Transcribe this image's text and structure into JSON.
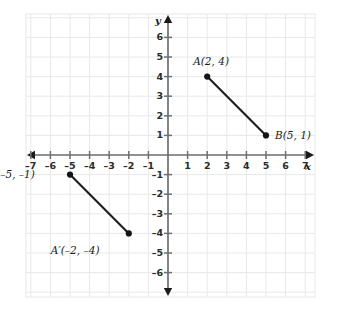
{
  "figure": {
    "type": "coordinate-plane",
    "axis_labels": {
      "x": "x",
      "y": "y"
    },
    "x_axis": {
      "min": -7,
      "max": 7,
      "ticks": [
        -7,
        -6,
        -5,
        -4,
        -3,
        -2,
        -1,
        1,
        2,
        3,
        4,
        5,
        6,
        7
      ],
      "tick_labels": [
        "–7",
        "–6",
        "–5",
        "–4",
        "–3",
        "–2",
        "–1",
        "1",
        "2",
        "3",
        "4",
        "5",
        "6",
        "7"
      ],
      "zero_label_shown": false
    },
    "y_axis": {
      "min": -6,
      "max": 6,
      "ticks": [
        6,
        5,
        4,
        3,
        2,
        1,
        -1,
        -2,
        -3,
        -4,
        -5,
        -6
      ],
      "tick_labels": [
        "6",
        "5",
        "4",
        "3",
        "2",
        "1",
        "–1",
        "–2",
        "–3",
        "–4",
        "–5",
        "–6"
      ],
      "zero_label_shown": false
    },
    "grid": {
      "visible": true,
      "spacing": 1,
      "color": "#e8e8ea"
    },
    "colors": {
      "axis": "#6f6f74",
      "arrow": "#1a1a1a",
      "segment": "#1d1d22",
      "point": "#151518",
      "grid": "#e8e8ea",
      "label_text": "#1a1a1a"
    }
  },
  "chart_data": {
    "type": "scatter",
    "title": "",
    "xlabel": "x",
    "ylabel": "y",
    "xlim": [
      -7,
      7
    ],
    "ylim": [
      -6,
      6
    ],
    "grid": true,
    "legend": "none",
    "points": [
      {
        "name": "A",
        "label": "A(2, 4)",
        "x": 2,
        "y": 4
      },
      {
        "name": "B",
        "label": "B(5, 1)",
        "x": 5,
        "y": 1
      },
      {
        "name": "B'",
        "label": "B′(–5, –1)",
        "x": -5,
        "y": -1
      },
      {
        "name": "A'",
        "label": "A′(–2, –4)",
        "x": -2,
        "y": -4
      }
    ],
    "segments": [
      {
        "name": "AB",
        "from": "A",
        "to": "B"
      },
      {
        "name": "A'B'",
        "from": "B'",
        "to": "A'"
      }
    ],
    "annotations": [
      {
        "text": "A(2, 4)",
        "anchor": "A",
        "placement": "above-left"
      },
      {
        "text": "B(5, 1)",
        "anchor": "B",
        "placement": "right"
      },
      {
        "text": "B′(–5, –1)",
        "anchor": "B'",
        "placement": "left"
      },
      {
        "text": "A′(–2, –4)",
        "anchor": "A'",
        "placement": "below-left"
      }
    ]
  }
}
